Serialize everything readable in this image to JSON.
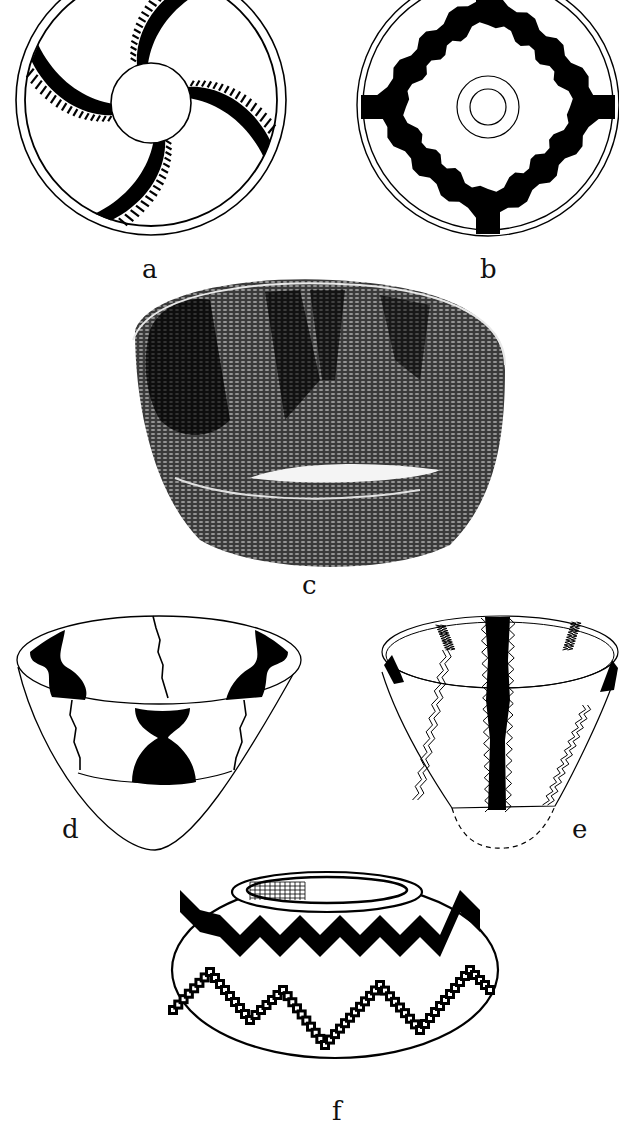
{
  "figure": {
    "panels": [
      {
        "id": "a",
        "label": "a",
        "description": "Basket bottom plan view: four-armed whirl design with serrated (ticked) arms around a plain center circle, double rim circle"
      },
      {
        "id": "b",
        "label": "b",
        "description": "Basket bottom plan view: stepped cross/diamond band design with concentric center circles, double rim circle"
      },
      {
        "id": "c",
        "label": "c",
        "description": "Photograph of coiled basket bowl with dark vertical design bands"
      },
      {
        "id": "d",
        "label": "d",
        "description": "Conical basket drawing with black hourglass motifs and thin zigzag lines"
      },
      {
        "id": "e",
        "label": "e",
        "description": "Conical basket drawing with black zigzag vertical band and double zigzag outline stripes, dashed base"
      },
      {
        "id": "f",
        "label": "f",
        "description": "Globular basket drawing with black zigzag band and checkered zigzag band, crosshatched rim interior"
      }
    ]
  },
  "colors": {
    "ink": "#000000",
    "paper": "#ffffff",
    "photo_dark": "#1a1a1a",
    "photo_mid": "#555555"
  }
}
